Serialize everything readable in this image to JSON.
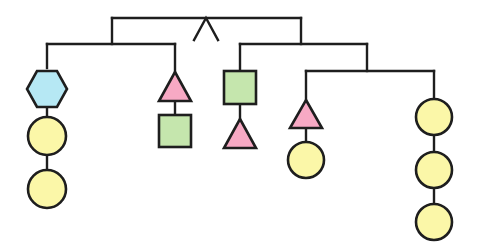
{
  "diagram": {
    "type": "hanging-mobile",
    "colors": {
      "line": "#1e1e1e",
      "circle_fill": "#fbf7a8",
      "triangle_fill": "#f7a9c4",
      "square_fill": "#c5e6ad",
      "hexagon_fill": "#b6e8f4",
      "background": "#ffffff"
    },
    "pivot": {
      "shape": "caret",
      "x": 206,
      "y": 18
    },
    "rods": [
      {
        "id": "top",
        "x1": 112,
        "x2": 301,
        "y": 18
      },
      {
        "id": "left",
        "x1": 47,
        "x2": 175,
        "y": 44
      },
      {
        "id": "middle",
        "x1": 240,
        "x2": 367,
        "y": 44
      },
      {
        "id": "lower-right",
        "x1": 306,
        "x2": 434,
        "y": 71
      }
    ],
    "hangers": [
      {
        "name": "left-strand",
        "x": 47,
        "items": [
          "hexagon",
          "circle",
          "circle"
        ]
      },
      {
        "name": "left-center-strand",
        "x": 175,
        "items": [
          "triangle",
          "square"
        ]
      },
      {
        "name": "middle-strand",
        "x": 240,
        "items": [
          "square",
          "triangle"
        ]
      },
      {
        "name": "lower-left-strand",
        "x": 306,
        "items": [
          "triangle",
          "circle"
        ]
      },
      {
        "name": "right-strand",
        "x": 434,
        "items": [
          "circle",
          "circle",
          "circle"
        ]
      }
    ],
    "shape_counts": {
      "circle": 6,
      "triangle": 3,
      "square": 2,
      "hexagon": 1
    }
  }
}
